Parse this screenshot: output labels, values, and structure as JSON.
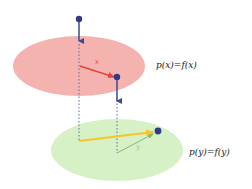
{
  "labels": {
    "top_equation": "p(x)=f(x)",
    "bottom_equation": "p(y)=f(y)",
    "top_vector": "x",
    "bottom_vector": "y"
  },
  "colors": {
    "top_plane": "#f5b3b0",
    "bottom_plane": "#d6f1c6",
    "point": "#2f3b86",
    "drop_arrow": "#3b4a92",
    "top_vector": "#e5443a",
    "sum_vector": "#f6c624",
    "bottom_vector": "#86b77a",
    "guide_line": "#5c6aa8"
  }
}
